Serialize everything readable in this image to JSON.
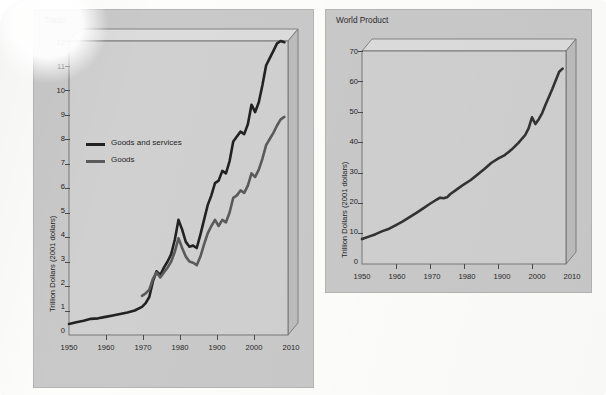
{
  "caption": "Projections of global trade trends from WTO, and trends in world product from OECD and IMF.",
  "colors": {
    "page_background": "#fdfdfc",
    "panel_background": "#c9c9c9",
    "plot_background": "#d0d0d0",
    "box_top_face": "#dcdcdc",
    "box_right_face": "#bdbdbd",
    "series_goods_and_services": "#222222",
    "series_goods": "#5a5a5a",
    "series_world_product": "#333333",
    "axis": "#4a4a4a"
  },
  "panels": {
    "trade": {
      "title": "Trade",
      "legend": [
        {
          "label": "Goods and services",
          "color": "#222222"
        },
        {
          "label": "Goods",
          "color": "#5a5a5a"
        }
      ]
    },
    "world_product": {
      "title": "World Product"
    }
  },
  "chart_data": [
    {
      "id": "trade",
      "type": "line",
      "title": "Trade",
      "xlabel": "",
      "ylabel": "Trillion Dollars (2001 dollars)",
      "xlim": [
        1950,
        2010
      ],
      "ylim": [
        0,
        12
      ],
      "xticks": [
        1950,
        1960,
        1970,
        1980,
        1900,
        2000,
        2010
      ],
      "xtick_labels": [
        "1950",
        "1960",
        "1970",
        "1980",
        "1900",
        "2000",
        "2010"
      ],
      "yticks": [
        0,
        1,
        2,
        3,
        4,
        5,
        6,
        7,
        8,
        9,
        10,
        11,
        12
      ],
      "ytick_labels": [
        "0",
        "1",
        "2",
        "3",
        "4",
        "5",
        "6",
        "7",
        "8",
        "9",
        "10",
        "11",
        "12"
      ],
      "grid": false,
      "legend_position": "upper left",
      "series": [
        {
          "name": "Goods and services",
          "color": "#222222",
          "x": [
            1950,
            1952,
            1954,
            1956,
            1958,
            1960,
            1962,
            1964,
            1966,
            1968,
            1970,
            1971,
            1972,
            1973,
            1974,
            1975,
            1976,
            1977,
            1978,
            1979,
            1980,
            1981,
            1982,
            1983,
            1984,
            1985,
            1986,
            1987,
            1988,
            1989,
            1990,
            1991,
            1992,
            1993,
            1994,
            1995,
            1996,
            1997,
            1998,
            1999,
            2000,
            2001,
            2002,
            2003,
            2004,
            2005,
            2006,
            2007,
            2008,
            2009
          ],
          "y": [
            0.45,
            0.52,
            0.58,
            0.66,
            0.68,
            0.74,
            0.8,
            0.86,
            0.92,
            1.0,
            1.15,
            1.3,
            1.55,
            2.2,
            2.6,
            2.45,
            2.75,
            3.0,
            3.3,
            3.9,
            4.7,
            4.3,
            3.8,
            3.6,
            3.65,
            3.55,
            4.1,
            4.7,
            5.3,
            5.7,
            6.2,
            6.3,
            6.7,
            6.6,
            7.1,
            7.9,
            8.1,
            8.3,
            8.2,
            8.6,
            9.4,
            9.1,
            9.5,
            10.2,
            11.0,
            11.3,
            11.6,
            11.9,
            12.0,
            11.95
          ]
        },
        {
          "name": "Goods",
          "color": "#5a5a5a",
          "x": [
            1970,
            1971,
            1972,
            1973,
            1974,
            1975,
            1976,
            1977,
            1978,
            1979,
            1980,
            1981,
            1982,
            1983,
            1984,
            1985,
            1986,
            1987,
            1988,
            1989,
            1990,
            1991,
            1992,
            1993,
            1994,
            1995,
            1996,
            1997,
            1998,
            1999,
            2000,
            2001,
            2002,
            2003,
            2004,
            2005,
            2006,
            2007,
            2008,
            2009
          ],
          "y": [
            1.6,
            1.7,
            1.85,
            2.3,
            2.55,
            2.35,
            2.55,
            2.75,
            3.0,
            3.4,
            3.95,
            3.55,
            3.2,
            3.0,
            2.95,
            2.85,
            3.2,
            3.7,
            4.15,
            4.45,
            4.7,
            4.45,
            4.7,
            4.6,
            5.0,
            5.6,
            5.7,
            5.9,
            5.8,
            6.1,
            6.6,
            6.45,
            6.75,
            7.2,
            7.75,
            8.0,
            8.25,
            8.55,
            8.8,
            8.9
          ]
        }
      ]
    },
    {
      "id": "world_product",
      "type": "line",
      "title": "World Product",
      "xlabel": "",
      "ylabel": "Trillion Dollars (2001 dollars)",
      "xlim": [
        1950,
        2010
      ],
      "ylim": [
        0,
        70
      ],
      "xticks": [
        1950,
        1960,
        1970,
        1980,
        1900,
        2000,
        2010
      ],
      "xtick_labels": [
        "1950",
        "1960",
        "1970",
        "1980",
        "1900",
        "2000",
        "2010"
      ],
      "yticks": [
        0,
        10,
        20,
        30,
        40,
        50,
        60,
        70
      ],
      "ytick_labels": [
        "0",
        "10",
        "20",
        "30",
        "40",
        "50",
        "60",
        "70"
      ],
      "grid": false,
      "legend_position": "none",
      "series": [
        {
          "name": "World Product",
          "color": "#333333",
          "x": [
            1950,
            1952,
            1954,
            1956,
            1958,
            1960,
            1962,
            1964,
            1966,
            1968,
            1970,
            1972,
            1973,
            1974,
            1975,
            1976,
            1978,
            1980,
            1982,
            1984,
            1986,
            1988,
            1990,
            1992,
            1994,
            1996,
            1998,
            1999,
            2000,
            2001,
            2002,
            2003,
            2004,
            2005,
            2006,
            2007,
            2008,
            2009
          ],
          "y": [
            8.2,
            9.0,
            9.8,
            10.8,
            11.6,
            12.8,
            14.0,
            15.4,
            16.8,
            18.3,
            19.8,
            21.2,
            21.8,
            21.6,
            21.9,
            23.0,
            24.6,
            26.2,
            27.6,
            29.4,
            31.2,
            33.2,
            34.6,
            35.8,
            37.6,
            39.8,
            42.4,
            44.6,
            48.2,
            46.0,
            47.6,
            49.6,
            52.4,
            55.0,
            57.6,
            60.4,
            63.2,
            64.2
          ]
        }
      ]
    }
  ]
}
